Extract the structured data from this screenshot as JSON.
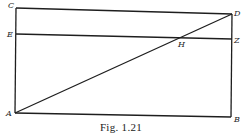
{
  "figure": {
    "caption": "Fig. 1.21",
    "stroke_color": "#1e1e1e",
    "points": {
      "C": {
        "label": "C",
        "x": 16,
        "y": 8
      },
      "D": {
        "label": "D",
        "x": 232,
        "y": 14
      },
      "E": {
        "label": "E",
        "x": 16,
        "y": 34
      },
      "Z": {
        "label": "Z",
        "x": 232,
        "y": 39
      },
      "H": {
        "label": "H",
        "x": 185,
        "y": 38
      },
      "A": {
        "label": "A",
        "x": 15,
        "y": 113
      },
      "B": {
        "label": "B",
        "x": 231,
        "y": 117
      }
    },
    "segments": [
      {
        "from": "C",
        "to": "D"
      },
      {
        "from": "E",
        "to": "Z"
      },
      {
        "from": "C",
        "to": "A"
      },
      {
        "from": "D",
        "to": "B"
      },
      {
        "from": "A",
        "to": "B"
      },
      {
        "from": "A",
        "to": "D"
      }
    ]
  }
}
